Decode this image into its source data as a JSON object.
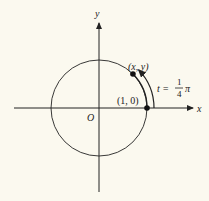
{
  "figure": {
    "type": "unit-circle",
    "axes": {
      "x_label": "x",
      "y_label": "y",
      "origin_label": "O"
    },
    "points": [
      {
        "name": "start",
        "label": "(1, 0)",
        "angle_rad": 0
      },
      {
        "name": "end",
        "label": "(x, y)",
        "angle_rad": 0.785398
      }
    ],
    "arc_label": {
      "lhs": "t =",
      "numerator": "1",
      "denominator": "4",
      "symbol": "π"
    },
    "colors": {
      "ink": "#222222",
      "paper": "#fbf9ef"
    }
  }
}
